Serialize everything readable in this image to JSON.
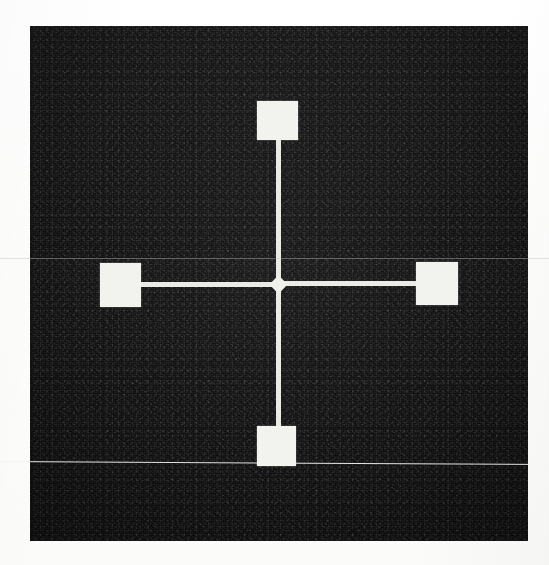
{
  "image": {
    "kind": "scanned-micrograph",
    "caption": "",
    "width": 549,
    "height": 565,
    "background_color": "#ffffff",
    "field_color": "#121212",
    "pattern_color": "#f2f2ee",
    "scan_artifact_color": "#f5f5f0"
  },
  "field": {
    "label": "dark imaged substrate field",
    "left": 30,
    "top": 26,
    "width": 498,
    "height": 515
  },
  "device": {
    "label": "four-terminal cross structure",
    "junction": {
      "label": "center junction",
      "cx": 278,
      "cy": 284,
      "size": 13
    },
    "pads": [
      {
        "label": "top contact pad",
        "name": "pad-top",
        "left": 257,
        "top": 101,
        "width": 41,
        "height": 39
      },
      {
        "label": "left contact pad",
        "name": "pad-left",
        "left": 100,
        "top": 263,
        "width": 41,
        "height": 44
      },
      {
        "label": "right contact pad",
        "name": "pad-right",
        "left": 416,
        "top": 262,
        "width": 42,
        "height": 43
      },
      {
        "label": "bottom contact pad",
        "name": "pad-bottom",
        "left": 257,
        "top": 426,
        "width": 39,
        "height": 40
      }
    ],
    "traces": [
      {
        "label": "top trace",
        "name": "trace-top",
        "left": 276,
        "top": 138,
        "width": 5,
        "height": 148,
        "orientation": "vertical"
      },
      {
        "label": "bottom trace",
        "name": "trace-bottom",
        "left": 276,
        "top": 283,
        "width": 5,
        "height": 145,
        "orientation": "vertical"
      },
      {
        "label": "left trace",
        "name": "trace-left",
        "left": 139,
        "top": 282,
        "width": 142,
        "height": 5,
        "orientation": "horizontal"
      },
      {
        "label": "right trace",
        "name": "trace-right",
        "left": 277,
        "top": 281,
        "width": 142,
        "height": 5,
        "orientation": "horizontal"
      }
    ]
  },
  "artifacts": [
    {
      "label": "upper scan line",
      "name": "scanline-upper",
      "y": 258
    },
    {
      "label": "lower scan line",
      "name": "scanline-lower",
      "y": 461
    }
  ]
}
